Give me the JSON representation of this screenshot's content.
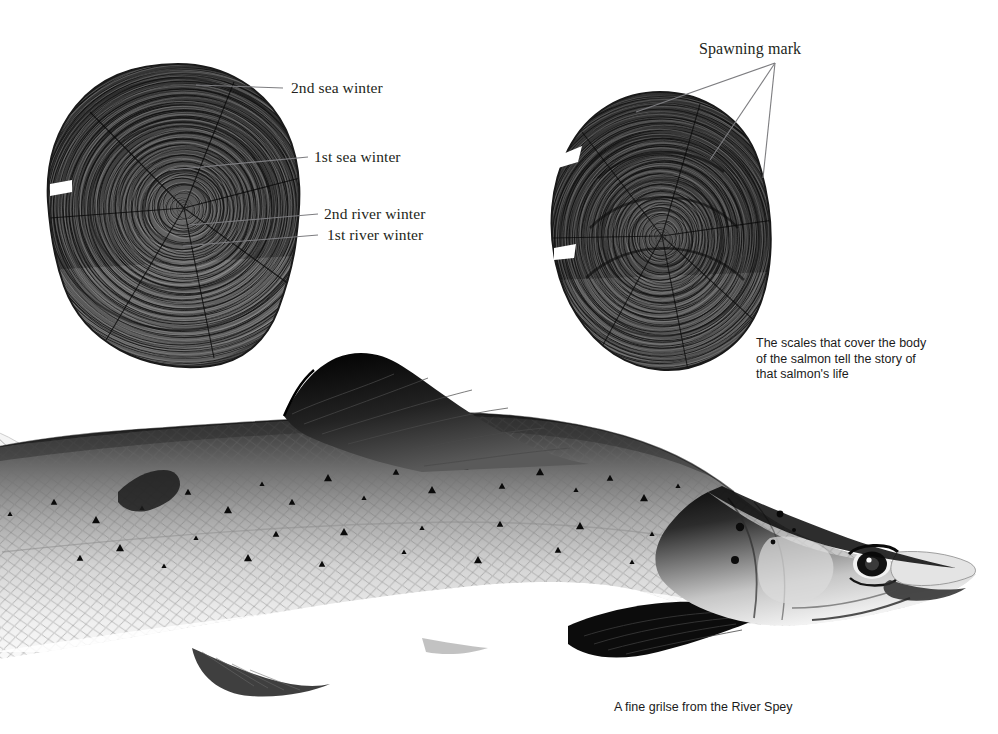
{
  "page": {
    "background_color": "#ffffff",
    "width": 998,
    "height": 734
  },
  "annotations": [
    {
      "id": "second-sea-winter",
      "label": "2nd sea winter",
      "x": 291,
      "y": 79,
      "leader": {
        "x1": 283,
        "y1": 88,
        "x2": 196,
        "y2": 85
      }
    },
    {
      "id": "first-sea-winter",
      "label": "1st sea winter",
      "x": 314,
      "y": 148,
      "leader": {
        "x1": 308,
        "y1": 157,
        "x2": 170,
        "y2": 170
      }
    },
    {
      "id": "second-river-winter",
      "label": "2nd river winter",
      "x": 324,
      "y": 205,
      "leader": {
        "x1": 318,
        "y1": 214,
        "x2": 189,
        "y2": 225
      }
    },
    {
      "id": "first-river-winter",
      "label": "1st river winter",
      "x": 327,
      "y": 226,
      "leader": {
        "x1": 318,
        "y1": 235,
        "x2": 183,
        "y2": 246
      }
    },
    {
      "id": "spawning-mark",
      "label": "Spawning mark",
      "x": 699,
      "y": 40,
      "leaders": [
        {
          "x1": 775,
          "y1": 63,
          "x2": 636,
          "y2": 112
        },
        {
          "x1": 775,
          "y1": 63,
          "x2": 710,
          "y2": 160
        },
        {
          "x1": 775,
          "y1": 63,
          "x2": 763,
          "y2": 178
        }
      ]
    }
  ],
  "captions": {
    "scales": {
      "text": "The scales that cover the body\nof the salmon tell the story of\nthat salmon's life",
      "x": 756,
      "y": 336
    },
    "fish": {
      "text": "A fine grilse from the River Spey",
      "x": 614,
      "y": 700
    }
  },
  "figures": {
    "scale_left": {
      "name": "salmon-scale-left",
      "description": "Salmon scale with growth rings showing river and sea winters",
      "x": 30,
      "y": 60,
      "width": 280,
      "height": 305
    },
    "scale_right": {
      "name": "salmon-scale-right",
      "description": "Salmon scale with spawning marks",
      "x": 540,
      "y": 90,
      "width": 235,
      "height": 275
    },
    "fish": {
      "name": "atlantic-salmon-grilse",
      "description": "Lateral view of an Atlantic salmon grilse",
      "x": 0,
      "y": 355,
      "width": 980,
      "height": 350
    }
  },
  "colors": {
    "leader_line": "#7d7d80",
    "text": "#231f20",
    "background": "#ffffff"
  }
}
